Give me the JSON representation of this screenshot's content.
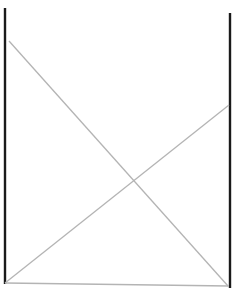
{
  "canvas": {
    "width": 232,
    "height": 292,
    "background": "#ffffff"
  },
  "colors": {
    "frame": "#1a1a1a",
    "diagonal": "#b4b4b4"
  },
  "lines": {
    "left_post": {
      "x1": 5,
      "y1": 8,
      "x2": 5,
      "y2": 284
    },
    "right_post": {
      "x1": 230,
      "y1": 13,
      "x2": 230,
      "y2": 288
    },
    "diagonal_down": {
      "x1": 9,
      "y1": 41,
      "x2": 228,
      "y2": 286
    },
    "diagonal_up": {
      "x1": 5,
      "y1": 283,
      "x2": 229,
      "y2": 105
    },
    "base": {
      "x1": 5,
      "y1": 283,
      "x2": 229,
      "y2": 286
    }
  }
}
